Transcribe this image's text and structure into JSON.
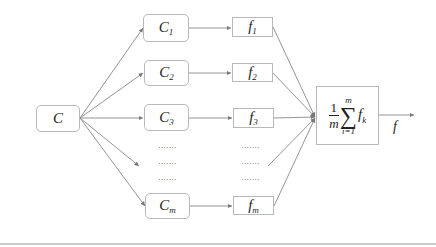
{
  "diagram": {
    "input_node": {
      "label": "C"
    },
    "component_nodes": [
      {
        "label": "C",
        "sub": "1"
      },
      {
        "label": "C",
        "sub": "2"
      },
      {
        "label": "C",
        "sub": "3"
      },
      {
        "label": "C",
        "sub": "m"
      }
    ],
    "function_nodes": [
      {
        "label": "f",
        "sub": "1"
      },
      {
        "label": "f",
        "sub": "2"
      },
      {
        "label": "f",
        "sub": "3"
      },
      {
        "label": "f",
        "sub": "m"
      }
    ],
    "ellipsis": "·······",
    "aggregator": {
      "numerator": "1",
      "denominator": "m",
      "sum_upper": "m",
      "sum_lower": "i=1",
      "sigma": "∑",
      "term": "f",
      "term_sub": "k"
    },
    "output": {
      "label": "f"
    },
    "colors": {
      "stroke": "#888888",
      "box_border": "#b8b8b8",
      "text": "#222222"
    }
  }
}
